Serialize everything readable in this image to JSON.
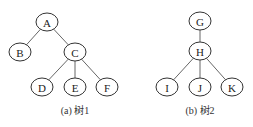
{
  "diagram": {
    "trees": [
      {
        "caption": "(a) 树1",
        "caption_pos": [
          75,
          114
        ],
        "nodes": [
          {
            "id": "A",
            "label": "A",
            "x": 47,
            "y": 22
          },
          {
            "id": "B",
            "label": "B",
            "x": 20,
            "y": 52
          },
          {
            "id": "C",
            "label": "C",
            "x": 75,
            "y": 52
          },
          {
            "id": "D",
            "label": "D",
            "x": 42,
            "y": 87
          },
          {
            "id": "E",
            "label": "E",
            "x": 75,
            "y": 87
          },
          {
            "id": "F",
            "label": "F",
            "x": 107,
            "y": 87
          }
        ],
        "edges": [
          [
            "A",
            "B"
          ],
          [
            "A",
            "C"
          ],
          [
            "C",
            "D"
          ],
          [
            "C",
            "E"
          ],
          [
            "C",
            "F"
          ]
        ]
      },
      {
        "caption": "(b) 树2",
        "caption_pos": [
          200,
          114
        ],
        "nodes": [
          {
            "id": "G",
            "label": "G",
            "x": 200,
            "y": 21
          },
          {
            "id": "H",
            "label": "H",
            "x": 200,
            "y": 51
          },
          {
            "id": "I",
            "label": "I",
            "x": 167,
            "y": 87
          },
          {
            "id": "J",
            "label": "J",
            "x": 200,
            "y": 87
          },
          {
            "id": "K",
            "label": "K",
            "x": 232,
            "y": 87
          }
        ],
        "edges": [
          [
            "G",
            "H"
          ],
          [
            "H",
            "I"
          ],
          [
            "H",
            "J"
          ],
          [
            "H",
            "K"
          ]
        ]
      }
    ],
    "node_rx": 11,
    "node_ry": 9
  }
}
